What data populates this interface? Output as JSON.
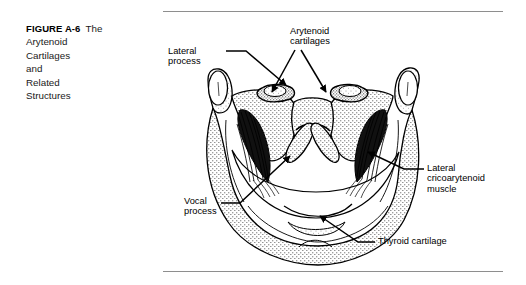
{
  "figure": {
    "number": "FIGURE A-6",
    "caption_lines": [
      "The",
      "Arytenoid",
      "Cartilages",
      "and",
      "Related",
      "Structures"
    ],
    "caption_full": "The Arytenoid Cartilages and Related Structures"
  },
  "labels": {
    "lateral_process": [
      "Lateral",
      "process"
    ],
    "arytenoid_cartilages": [
      "Arytenoid",
      "cartilages"
    ],
    "vocal_process": [
      "Vocal",
      "process"
    ],
    "lateral_cricoarytenoid_muscle": [
      "Lateral",
      "cricoarytenoid",
      "muscle"
    ],
    "thyroid_cartilage": [
      "Thyroid  cartilage"
    ]
  },
  "illustration": {
    "subject": "superior view of the larynx showing arytenoid cartilages and related structures",
    "style": "black-and-white stippled line drawing"
  },
  "colors": {
    "ink": "#000000",
    "rule": "#8e8e8e",
    "background": "#ffffff",
    "caption_text": "#1a1a1a"
  }
}
